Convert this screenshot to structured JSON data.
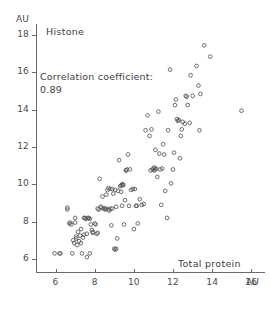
{
  "chart_data": {
    "type": "scatter",
    "title": "Histone",
    "xlabel": "Total protein",
    "ylabel": "Histone",
    "x_unit": "AU",
    "y_unit": "AU",
    "xlim": [
      5.0,
      16.7
    ],
    "ylim": [
      5.3,
      18.6
    ],
    "xticks": [
      6,
      8,
      10,
      12,
      14,
      16
    ],
    "yticks": [
      6,
      8,
      10,
      12,
      14,
      16,
      18
    ],
    "grid": false,
    "legend": null,
    "marker": "open-circle",
    "annotations": [
      {
        "text": "Correlation coefficient:",
        "x": 6.0,
        "y": 15.2
      },
      {
        "text": "0.89",
        "x": 6.0,
        "y": 14.4
      }
    ],
    "correlation_coefficient": 0.89,
    "n_points": 145,
    "points": [
      [
        5.95,
        6.3
      ],
      [
        6.2,
        6.3
      ],
      [
        6.25,
        6.3
      ],
      [
        6.6,
        8.75
      ],
      [
        6.6,
        8.65
      ],
      [
        6.75,
        7.95
      ],
      [
        6.8,
        7.85
      ],
      [
        6.85,
        6.3
      ],
      [
        6.9,
        7.0
      ],
      [
        6.95,
        6.85
      ],
      [
        7.0,
        7.95
      ],
      [
        7.0,
        8.2
      ],
      [
        7.05,
        7.2
      ],
      [
        7.1,
        6.75
      ],
      [
        7.15,
        7.45
      ],
      [
        7.2,
        6.95
      ],
      [
        7.25,
        7.25
      ],
      [
        7.3,
        6.85
      ],
      [
        7.3,
        7.6
      ],
      [
        7.35,
        6.3
      ],
      [
        7.4,
        7.15
      ],
      [
        7.45,
        8.2
      ],
      [
        7.5,
        8.2
      ],
      [
        7.55,
        8.15
      ],
      [
        7.6,
        6.1
      ],
      [
        7.6,
        7.35
      ],
      [
        7.65,
        8.2
      ],
      [
        7.7,
        8.2
      ],
      [
        7.75,
        6.3
      ],
      [
        7.8,
        7.85
      ],
      [
        7.85,
        7.55
      ],
      [
        7.9,
        7.4
      ],
      [
        8.0,
        7.9
      ],
      [
        8.05,
        7.85
      ],
      [
        8.1,
        7.35
      ],
      [
        8.15,
        7.4
      ],
      [
        8.2,
        8.65
      ],
      [
        8.25,
        10.3
      ],
      [
        8.3,
        8.8
      ],
      [
        8.4,
        9.35
      ],
      [
        8.45,
        8.7
      ],
      [
        8.5,
        8.7
      ],
      [
        8.55,
        8.65
      ],
      [
        8.6,
        8.7
      ],
      [
        8.65,
        9.7
      ],
      [
        8.7,
        8.65
      ],
      [
        8.7,
        9.8
      ],
      [
        8.75,
        8.6
      ],
      [
        8.8,
        8.7
      ],
      [
        8.8,
        9.75
      ],
      [
        8.85,
        7.8
      ],
      [
        8.9,
        8.7
      ],
      [
        8.95,
        9.5
      ],
      [
        9.0,
        6.55
      ],
      [
        9.05,
        6.5
      ],
      [
        9.05,
        9.7
      ],
      [
        9.1,
        6.55
      ],
      [
        9.1,
        8.8
      ],
      [
        9.15,
        7.1
      ],
      [
        9.2,
        9.65
      ],
      [
        9.25,
        11.3
      ],
      [
        9.3,
        9.9
      ],
      [
        9.35,
        9.95
      ],
      [
        9.4,
        10.0
      ],
      [
        9.4,
        8.85
      ],
      [
        9.45,
        10.0
      ],
      [
        9.5,
        7.85
      ],
      [
        9.55,
        9.15
      ],
      [
        9.6,
        10.75
      ],
      [
        9.65,
        10.8
      ],
      [
        9.7,
        11.6
      ],
      [
        9.75,
        8.85
      ],
      [
        9.8,
        10.8
      ],
      [
        9.85,
        9.7
      ],
      [
        10.0,
        7.6
      ],
      [
        10.05,
        9.75
      ],
      [
        10.1,
        8.85
      ],
      [
        10.2,
        7.9
      ],
      [
        10.3,
        9.2
      ],
      [
        10.5,
        8.95
      ],
      [
        10.7,
        13.7
      ],
      [
        10.8,
        12.6
      ],
      [
        10.85,
        10.75
      ],
      [
        10.9,
        12.95
      ],
      [
        10.95,
        10.8
      ],
      [
        11.0,
        10.85
      ],
      [
        11.05,
        10.9
      ],
      [
        11.1,
        10.8
      ],
      [
        11.1,
        11.85
      ],
      [
        11.15,
        10.85
      ],
      [
        11.2,
        10.4
      ],
      [
        11.25,
        13.9
      ],
      [
        11.3,
        11.65
      ],
      [
        11.35,
        10.8
      ],
      [
        11.4,
        8.9
      ],
      [
        11.5,
        12.15
      ],
      [
        11.6,
        9.65
      ],
      [
        11.7,
        8.2
      ],
      [
        11.75,
        12.9
      ],
      [
        11.85,
        16.15
      ],
      [
        11.9,
        10.05
      ],
      [
        12.0,
        10.8
      ],
      [
        12.05,
        11.7
      ],
      [
        12.1,
        14.25
      ],
      [
        12.15,
        14.55
      ],
      [
        12.2,
        13.5
      ],
      [
        12.3,
        13.45
      ],
      [
        12.35,
        11.4
      ],
      [
        12.4,
        12.6
      ],
      [
        12.5,
        13.35
      ],
      [
        12.6,
        13.25
      ],
      [
        12.65,
        14.75
      ],
      [
        12.7,
        14.7
      ],
      [
        12.75,
        14.25
      ],
      [
        12.9,
        15.85
      ],
      [
        13.0,
        14.75
      ],
      [
        13.2,
        16.35
      ],
      [
        13.3,
        15.3
      ],
      [
        13.35,
        12.9
      ],
      [
        13.4,
        14.85
      ],
      [
        13.6,
        17.45
      ],
      [
        13.9,
        16.85
      ],
      [
        15.5,
        13.95
      ],
      [
        8.35,
        8.75
      ],
      [
        8.9,
        9.75
      ],
      [
        9.45,
        9.95
      ],
      [
        10.6,
        12.9
      ],
      [
        11.45,
        10.85
      ],
      [
        12.25,
        13.4
      ],
      [
        7.45,
        7.3
      ],
      [
        7.05,
        7.1
      ],
      [
        8.6,
        9.45
      ],
      [
        9.95,
        9.75
      ],
      [
        10.15,
        8.85
      ],
      [
        11.55,
        11.6
      ],
      [
        12.45,
        12.95
      ],
      [
        7.75,
        8.15
      ],
      [
        8.15,
        8.7
      ],
      [
        9.35,
        9.6
      ],
      [
        10.4,
        8.9
      ],
      [
        11.05,
        10.75
      ],
      [
        6.7,
        7.9
      ],
      [
        7.9,
        7.45
      ],
      [
        9.6,
        10.75
      ],
      [
        12.85,
        13.3
      ]
    ]
  },
  "axes": {
    "y_unit_label": "AU",
    "x_unit_label": "AU",
    "x_axis_name": "Total protein",
    "y_tick_labels": [
      "18",
      "16",
      "14",
      "12",
      "10",
      "8",
      "6"
    ],
    "x_tick_labels": [
      "6",
      "8",
      "10",
      "12",
      "14",
      "16"
    ]
  }
}
